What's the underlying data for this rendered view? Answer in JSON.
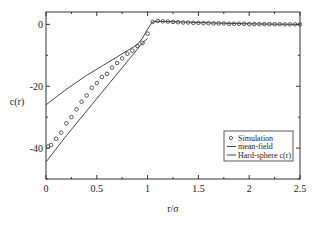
{
  "chart_data": {
    "type": "line",
    "title": "",
    "xlabel": "r/σ",
    "ylabel": "c(r)",
    "xlim": [
      0,
      2.5
    ],
    "ylim": [
      -50,
      4
    ],
    "xticks": [
      0,
      0.5,
      1,
      1.5,
      2,
      2.5
    ],
    "xtick_labels": [
      "0",
      "0.5",
      "1",
      "1.5",
      "2",
      "2.5"
    ],
    "yticks": [
      0,
      -20,
      -40
    ],
    "ytick_labels": [
      "0",
      "-20",
      "-40"
    ],
    "grid": false,
    "legend_position": "right",
    "series": [
      {
        "name": "Simulation",
        "style": "markers",
        "x": [
          0.02,
          0.05,
          0.1,
          0.15,
          0.2,
          0.25,
          0.3,
          0.35,
          0.4,
          0.45,
          0.5,
          0.55,
          0.6,
          0.65,
          0.7,
          0.75,
          0.8,
          0.85,
          0.9,
          0.95,
          1.0,
          1.05,
          1.1,
          1.15,
          1.2,
          1.25,
          1.3,
          1.35,
          1.4,
          1.45,
          1.5,
          1.55,
          1.6,
          1.65,
          1.7,
          1.75,
          1.8,
          1.85,
          1.9,
          1.95,
          2.0,
          2.05,
          2.1,
          2.15,
          2.2,
          2.25,
          2.3,
          2.35,
          2.4,
          2.45,
          2.5
        ],
        "y": [
          -39.5,
          -39,
          -37,
          -35,
          -32,
          -30,
          -27.5,
          -25,
          -23,
          -20.5,
          -19,
          -17,
          -16,
          -14,
          -12.5,
          -11,
          -9.5,
          -8.5,
          -7,
          -6,
          -3,
          0.8,
          1.1,
          1.0,
          0.9,
          0.8,
          0.7,
          0.6,
          0.6,
          0.5,
          0.5,
          0.4,
          0.4,
          0.3,
          0.3,
          0.3,
          0.2,
          0.2,
          0.2,
          0.2,
          0.1,
          0.1,
          0.1,
          0.1,
          0.1,
          0.05,
          0.05,
          0.0,
          0.0,
          0.0,
          0.0
        ]
      },
      {
        "name": "mean-field",
        "style": "line",
        "x": [
          0,
          0.2,
          0.4,
          0.6,
          0.8,
          0.9,
          0.95,
          1.0,
          1.05,
          1.1,
          1.2,
          1.4,
          1.6,
          1.8,
          2.0,
          2.2,
          2.5
        ],
        "y": [
          -26,
          -21,
          -16.5,
          -12.5,
          -8.5,
          -6.5,
          -4.5,
          -1.5,
          0.8,
          1.0,
          0.9,
          0.7,
          0.5,
          0.3,
          0.2,
          0.1,
          0.0
        ]
      },
      {
        "name": "Hard-sphere c(r)",
        "style": "line",
        "x": [
          0,
          0.2,
          0.4,
          0.6,
          0.8,
          0.9,
          0.95,
          1.0
        ],
        "y": [
          -44.5,
          -36,
          -28,
          -20,
          -12,
          -8,
          -6,
          -4.5
        ]
      }
    ]
  }
}
